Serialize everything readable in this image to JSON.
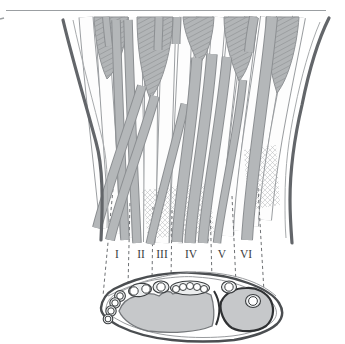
{
  "figure": {
    "labels": [
      "I",
      "II",
      "III",
      "IV",
      "V",
      "VI"
    ]
  },
  "colors": {
    "background": "#ffffff",
    "top_rule": "#9b9fa2",
    "skin_contour": "#63666a",
    "tendon_outline": "#9b9ea1",
    "tendon_fill": "#fdfdfd",
    "highlight_tendon": "#b4b7b9",
    "highlight_outline": "#8c8f92",
    "muscle_fill": "#b2b5b7",
    "guide_dash": "#6e7174",
    "label_text": "#3a3c3e",
    "cross_section_outline": "#4b4e51",
    "bone_fill": "#c6c8ca",
    "ulna_outline": "#2f3133",
    "tendon_ring": "#3b3e40",
    "pouch_fill": "#eceeef"
  }
}
